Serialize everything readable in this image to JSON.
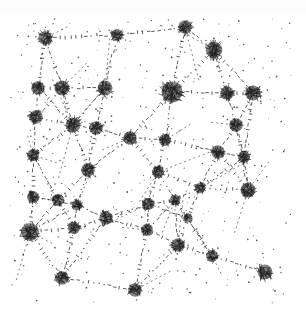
{
  "artwork": {
    "description": "Abstract ink drawing: scribbled dark clusters (nodes) connected by dashed, tick-marked lines on a white background",
    "background": "#ffffff",
    "ink_color": "#1e1e1e",
    "canvas": {
      "width": 306,
      "height": 319
    },
    "nodes": [
      [
        45,
        38,
        9
      ],
      [
        117,
        35,
        8
      ],
      [
        185,
        27,
        9
      ],
      [
        214,
        50,
        11
      ],
      [
        38,
        88,
        9
      ],
      [
        62,
        88,
        10
      ],
      [
        105,
        88,
        10
      ],
      [
        172,
        92,
        14
      ],
      [
        227,
        93,
        9
      ],
      [
        253,
        93,
        10
      ],
      [
        36,
        117,
        9
      ],
      [
        73,
        125,
        10
      ],
      [
        96,
        128,
        9
      ],
      [
        130,
        138,
        9
      ],
      [
        165,
        140,
        8
      ],
      [
        236,
        125,
        9
      ],
      [
        218,
        152,
        9
      ],
      [
        244,
        157,
        8
      ],
      [
        33,
        155,
        8
      ],
      [
        88,
        170,
        9
      ],
      [
        158,
        172,
        8
      ],
      [
        33,
        197,
        8
      ],
      [
        58,
        200,
        8
      ],
      [
        77,
        205,
        7
      ],
      [
        106,
        218,
        9
      ],
      [
        148,
        204,
        8
      ],
      [
        175,
        200,
        7
      ],
      [
        200,
        188,
        7
      ],
      [
        248,
        190,
        10
      ],
      [
        30,
        232,
        12
      ],
      [
        74,
        228,
        8
      ],
      [
        147,
        230,
        8
      ],
      [
        188,
        218,
        6
      ],
      [
        178,
        245,
        9
      ],
      [
        212,
        256,
        8
      ],
      [
        265,
        272,
        10
      ],
      [
        62,
        278,
        9
      ],
      [
        135,
        290,
        9
      ]
    ]
  }
}
